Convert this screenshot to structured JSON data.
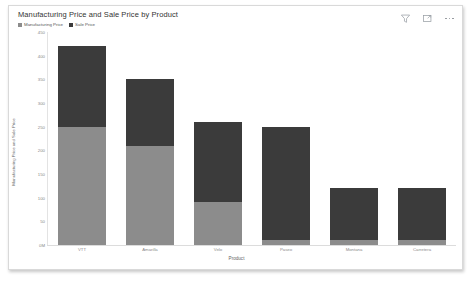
{
  "card": {
    "title": "Manufacturing Price and Sale Price by Product"
  },
  "toolbar": {
    "filter_icon": "filter-icon",
    "focus_icon": "focus-mode-icon",
    "more_icon": "more-options-icon"
  },
  "legend": {
    "items": [
      {
        "label": "Manufacturing Price",
        "color": "#8c8c8c"
      },
      {
        "label": "Sale Price",
        "color": "#3b3b3b"
      }
    ]
  },
  "chart_data": {
    "type": "bar",
    "stacked": true,
    "title": "Manufacturing Price and Sale Price by Product",
    "xlabel": "Product",
    "ylabel": "Manufacturing Price and Sale Price",
    "categories": [
      "VTT",
      "Amarilla",
      "Velo",
      "Paseo",
      "Montana",
      "Carretera"
    ],
    "series": [
      {
        "name": "Manufacturing Price",
        "color": "#8c8c8c",
        "values": [
          250,
          210,
          90,
          10,
          10,
          10
        ]
      },
      {
        "name": "Sale Price",
        "color": "#3b3b3b",
        "values": [
          170,
          140,
          170,
          240,
          110,
          110
        ]
      }
    ],
    "totals": [
      420,
      350,
      260,
      250,
      120,
      120
    ],
    "ylim": [
      0,
      450
    ],
    "yticks": [
      0,
      50,
      100,
      150,
      200,
      250,
      300,
      350,
      400,
      450
    ],
    "ytick_labels": [
      "0M",
      "50",
      "100",
      "150",
      "200",
      "250",
      "300",
      "350",
      "400",
      "450"
    ],
    "grid": false,
    "legend_position": "top-left"
  }
}
